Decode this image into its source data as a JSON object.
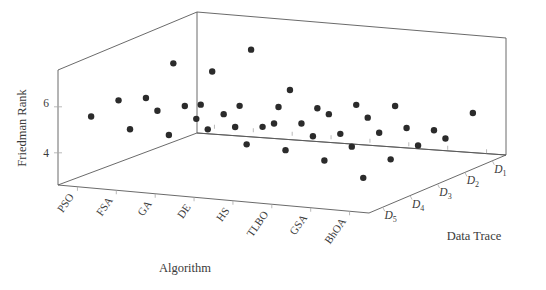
{
  "chart_data": {
    "type": "scatter",
    "title": "",
    "projection": "3d",
    "xlabel": "Algorithm",
    "ylabel": "Data Trace",
    "zlabel": "Friedman Rank",
    "x_categories": [
      "PSO",
      "FSA",
      "GA",
      "DE",
      "HS",
      "TLBO",
      "GSA",
      "BhOA"
    ],
    "y_categories": [
      "D1",
      "D2",
      "D3",
      "D4",
      "D5"
    ],
    "z_ticks": [
      4,
      6
    ],
    "zlim": [
      2.6,
      7.6
    ],
    "grid": false,
    "legend": false,
    "marker": {
      "shape": "circle",
      "color": "#2b2b2b",
      "size": 3.2
    },
    "series": [
      {
        "name": "D1",
        "points": [
          {
            "algorithm": "PSO",
            "rank": 3.9
          },
          {
            "algorithm": "FSA",
            "rank": 4.0
          },
          {
            "algorithm": "GA",
            "rank": 4.1
          },
          {
            "algorithm": "DE",
            "rank": 4.2
          },
          {
            "algorithm": "HS",
            "rank": 4.5
          },
          {
            "algorithm": "TLBO",
            "rank": 4.6
          },
          {
            "algorithm": "GSA",
            "rank": 3.7
          },
          {
            "algorithm": "BhOA",
            "rank": 4.6
          }
        ]
      },
      {
        "name": "D2",
        "points": [
          {
            "algorithm": "PSO",
            "rank": 6.2
          },
          {
            "algorithm": "FSA",
            "rank": 6.0
          },
          {
            "algorithm": "GA",
            "rank": 7.1
          },
          {
            "algorithm": "DE",
            "rank": 5.5
          },
          {
            "algorithm": "HS",
            "rank": 4.6
          },
          {
            "algorithm": "TLBO",
            "rank": 4.6
          },
          {
            "algorithm": "GSA",
            "rank": 4.3
          },
          {
            "algorithm": "BhOA",
            "rank": 4.0
          }
        ]
      },
      {
        "name": "D3",
        "points": [
          {
            "algorithm": "PSO",
            "rank": 5.2
          },
          {
            "algorithm": "FSA",
            "rank": 5.0
          },
          {
            "algorithm": "GA",
            "rank": 4.8
          },
          {
            "algorithm": "DE",
            "rank": 4.4
          },
          {
            "algorithm": "HS",
            "rank": 4.7
          },
          {
            "algorithm": "TLBO",
            "rank": 4.4
          },
          {
            "algorithm": "GSA",
            "rank": 4.6
          },
          {
            "algorithm": "BhOA",
            "rank": 4.2
          }
        ]
      },
      {
        "name": "D4",
        "points": [
          {
            "algorithm": "PSO",
            "rank": 5.6
          },
          {
            "algorithm": "FSA",
            "rank": 5.3
          },
          {
            "algorithm": "GA",
            "rank": 5.1
          },
          {
            "algorithm": "DE",
            "rank": 4.9
          },
          {
            "algorithm": "HS",
            "rank": 5.2
          },
          {
            "algorithm": "TLBO",
            "rank": 4.8
          },
          {
            "algorithm": "GSA",
            "rank": 4.5
          },
          {
            "algorithm": "BhOA",
            "rank": 4.1
          }
        ]
      },
      {
        "name": "D5",
        "points": [
          {
            "algorithm": "PSO",
            "rank": 5.4
          },
          {
            "algorithm": "FSA",
            "rank": 5.0
          },
          {
            "algorithm": "GA",
            "rank": 4.9
          },
          {
            "algorithm": "DE",
            "rank": 5.3
          },
          {
            "algorithm": "HS",
            "rank": 4.8
          },
          {
            "algorithm": "TLBO",
            "rank": 4.7
          },
          {
            "algorithm": "GSA",
            "rank": 4.4
          },
          {
            "algorithm": "BhOA",
            "rank": 3.8
          }
        ]
      }
    ]
  },
  "labels": {
    "zaxis_title": "Friedman Rank",
    "xaxis_title": "Algorithm",
    "yaxis_title": "Data Trace",
    "z_tick_4": "4",
    "z_tick_6": "6",
    "x_cats": [
      "PSO",
      "FSA",
      "GA",
      "DE",
      "HS",
      "TLBO",
      "GSA",
      "BhOA"
    ],
    "y_cats": [
      {
        "base": "D",
        "sub": "1"
      },
      {
        "base": "D",
        "sub": "2"
      },
      {
        "base": "D",
        "sub": "3"
      },
      {
        "base": "D",
        "sub": "4"
      },
      {
        "base": "D",
        "sub": "5"
      }
    ]
  },
  "colors": {
    "axis_line": "#595959",
    "text": "#3a3a3a",
    "marker": "#2b2b2b",
    "background": "#ffffff",
    "tick": "#a8a8a8"
  }
}
